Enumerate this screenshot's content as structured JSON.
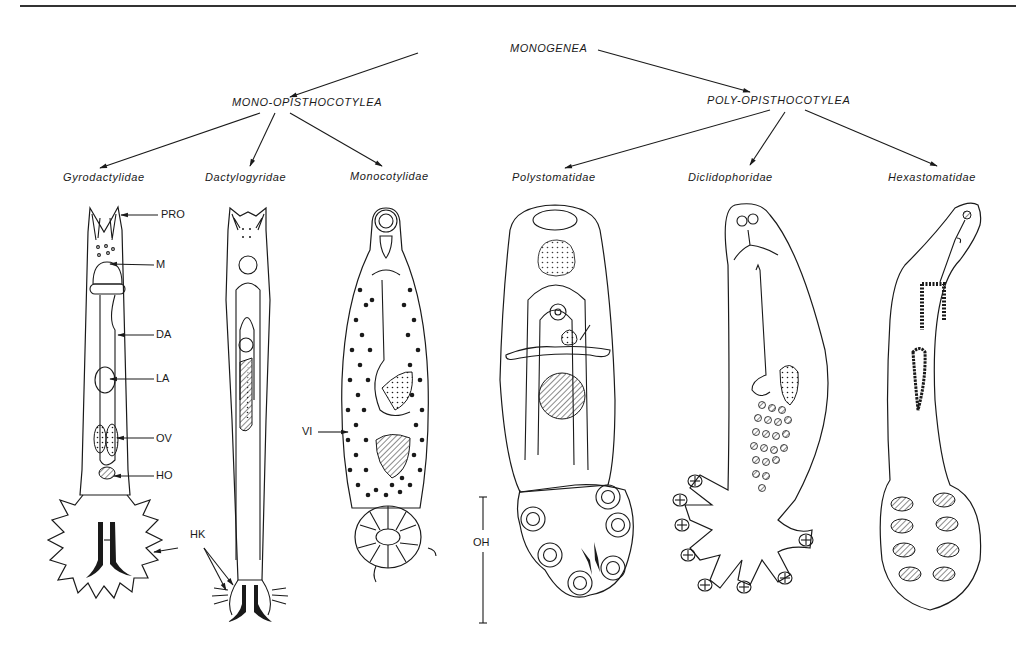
{
  "figure": {
    "root": "MONOGENEA",
    "orders": [
      {
        "name": "MONO-OPISTHOCOTYLEA",
        "families": [
          "Gyrodactylidae",
          "Dactylogyridae",
          "Monocotylidae"
        ]
      },
      {
        "name": "POLY-OPISTHOCOTYLEA",
        "families": [
          "Polystomatidae",
          "Diclidophoridae",
          "Hexastomatidae"
        ]
      }
    ],
    "anatomy_labels": {
      "pro": "PRO",
      "m": "M",
      "da": "DA",
      "la": "LA",
      "ov": "OV",
      "ho": "HO",
      "hk": "HK",
      "vi": "VI",
      "oh": "OH"
    },
    "colors": {
      "ink": "#1a1a1a",
      "background": "#ffffff"
    }
  }
}
